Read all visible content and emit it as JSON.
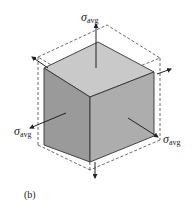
{
  "figure": {
    "caption": "(b)",
    "stress_label": "σ",
    "stress_subscript": "avg",
    "colors": {
      "top_face": "#c9c9c9",
      "left_face": "#9a9a9a",
      "right_face": "#adadad",
      "edge": "#333333",
      "dashed": "#444444",
      "arrow": "#222222"
    }
  },
  "labels": {
    "top": {
      "sigma": "σ",
      "sub": "avg"
    },
    "left": {
      "sigma": "σ",
      "sub": "avg"
    },
    "right": {
      "sigma": "σ",
      "sub": "avg"
    }
  }
}
